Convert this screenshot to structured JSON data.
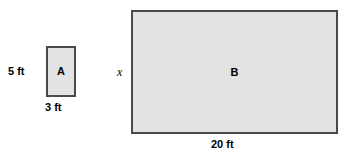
{
  "figure": {
    "background_color": "#ffffff",
    "width": 352,
    "height": 157,
    "shape_fill_color": "#e3e3e3",
    "shape_border_color": "#4a4a4a"
  },
  "shapes": {
    "rect_a": {
      "letter": "A",
      "height_label": "5 ft",
      "width_label": "3 ft"
    },
    "rect_b": {
      "letter": "B",
      "height_label": "x",
      "width_label": "20 ft"
    }
  }
}
